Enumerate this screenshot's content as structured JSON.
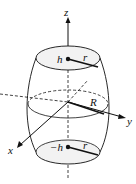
{
  "diagram": {
    "type": "barrel-solid",
    "labels": {
      "z_axis": "z",
      "y_axis": "y",
      "x_axis": "x",
      "top_height": "h",
      "bottom_height": "−h",
      "top_radius": "r",
      "bottom_radius": "r",
      "middle_radius": "R"
    },
    "colors": {
      "stroke": "#111111",
      "background": "#ffffff"
    }
  }
}
